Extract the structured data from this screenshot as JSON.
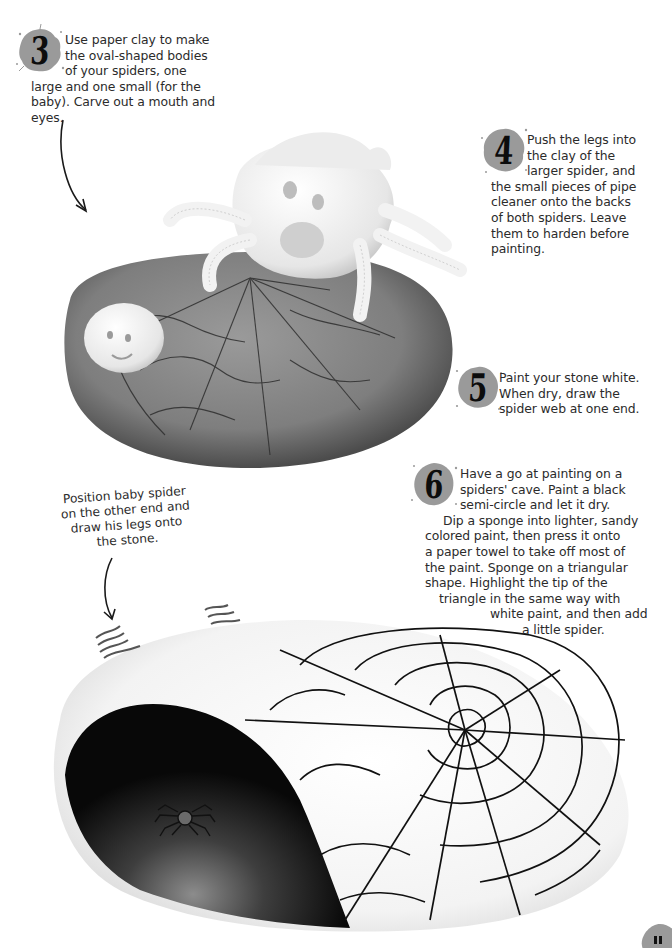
{
  "page": {
    "background": "#ffffff",
    "splat_color": "#9a9a9a",
    "text_color": "#2b2b2b"
  },
  "steps": [
    {
      "number": "3",
      "lines": [
        "Use paper clay to make",
        "the oval-shaped bodies",
        "of your spiders, one",
        "large and one small (for the",
        "baby). Carve out a mouth and",
        "eyes."
      ]
    },
    {
      "number": "4",
      "lines": [
        "Push the legs into",
        "the clay of the",
        "larger spider, and",
        "the small pieces of pipe",
        "cleaner onto the backs",
        "of both spiders. Leave",
        "them to harden before",
        "painting."
      ]
    },
    {
      "number": "5",
      "lines": [
        "Paint your stone white.",
        "When dry, draw the",
        "spider web at one end."
      ]
    },
    {
      "number": "6",
      "lines": [
        "Have a go at painting on a",
        "spiders' cave. Paint a black",
        "semi-circle and let it dry.",
        "Dip a sponge into lighter, sandy",
        "colored paint, then press it onto",
        "a paper towel to take off most of",
        "the paint. Sponge on a triangular",
        "shape. Highlight the tip of the",
        "triangle in the same way with",
        "white paint, and then add",
        "a little spider."
      ]
    }
  ],
  "caption": {
    "lines": [
      "Position baby spider",
      "on the other end and",
      "draw his legs onto",
      "the stone."
    ]
  },
  "photos": [
    {
      "label": "grey stone with clay spiders and drawn web",
      "stone_color": "#8a8a8a"
    },
    {
      "label": "white painted stone with black spider cave and web",
      "stone_color": "#f4f4f4",
      "cave_color": "#0b0b0b"
    }
  ]
}
